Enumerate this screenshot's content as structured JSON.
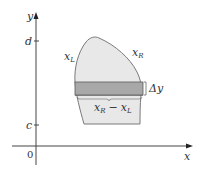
{
  "figure": {
    "axes": {
      "x_label": "x",
      "y_label": "y",
      "origin_label": "0",
      "y_ticks": [
        {
          "label": "d",
          "y": 41
        },
        {
          "label": "c",
          "y": 125
        }
      ]
    },
    "region": {
      "left_boundary_label": "x",
      "left_boundary_sub": "L",
      "right_boundary_label": "x",
      "right_boundary_sub": "R",
      "fill_color": "#e8e8e8",
      "stroke_color": "#7a7a7a"
    },
    "strip": {
      "thickness_label": "Δy",
      "width_label_a": "x",
      "width_label_a_sub": "R",
      "width_label_minus": "−",
      "width_label_b": "x",
      "width_label_b_sub": "L",
      "fill_color": "#a8a8a8"
    }
  }
}
